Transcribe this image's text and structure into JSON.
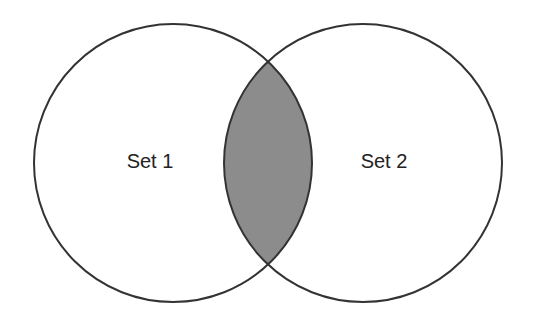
{
  "diagram": {
    "type": "venn",
    "sets": [
      {
        "label": "Set 1",
        "cx": 173,
        "cy": 163,
        "r": 139
      },
      {
        "label": "Set 2",
        "cx": 363,
        "cy": 163,
        "r": 139
      }
    ],
    "highlighted_region": "intersection",
    "colors": {
      "stroke": "#333333",
      "intersection_fill": "#8c8c8c",
      "background": "#ffffff"
    }
  }
}
